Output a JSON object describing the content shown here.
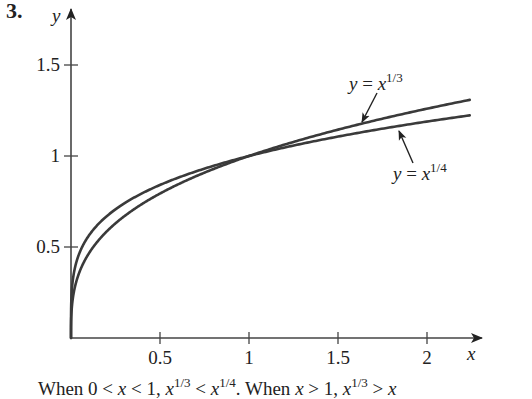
{
  "problem_number": "3.",
  "caption": {
    "prefix": "When 0 < ",
    "var1": "x",
    "mid1": " < 1, ",
    "base1": "x",
    "exp1": "1/3",
    "mid2": " < ",
    "base2": "x",
    "exp2": "1/4",
    "mid3": ". When ",
    "var2": "x",
    "mid4": " > 1, ",
    "base3": "x",
    "exp3": "1/3",
    "mid5": " > ",
    "base4": "x"
  },
  "colors": {
    "curve": "#3a3a3a",
    "axis": "#444444",
    "text": "#222222"
  },
  "chart_data": {
    "type": "line",
    "title": "",
    "xlabel": "x",
    "ylabel": "y",
    "xlim": [
      0,
      2.3
    ],
    "ylim": [
      0,
      1.6
    ],
    "grid": false,
    "legend_position": "annotations",
    "x_ticks": [
      {
        "value": 0.5,
        "label": "0.5"
      },
      {
        "value": 1,
        "label": "1"
      },
      {
        "value": 1.5,
        "label": "1.5"
      },
      {
        "value": 2,
        "label": "2"
      }
    ],
    "y_ticks": [
      {
        "value": 0.5,
        "label": "0.5"
      },
      {
        "value": 1,
        "label": "1"
      },
      {
        "value": 1.5,
        "label": "1.5"
      }
    ],
    "series": [
      {
        "name": "y = x^(1/3)",
        "label_base": "y = x",
        "label_exp": "1/3",
        "exponent": 0.3333333,
        "x": [
          0,
          0.01,
          0.05,
          0.1,
          0.25,
          0.5,
          0.75,
          1,
          1.25,
          1.5,
          1.75,
          2,
          2.24
        ],
        "values": [
          0,
          0.215,
          0.368,
          0.464,
          0.63,
          0.794,
          0.909,
          1,
          1.077,
          1.145,
          1.205,
          1.26,
          1.309
        ]
      },
      {
        "name": "y = x^(1/4)",
        "label_base": "y = x",
        "label_exp": "1/4",
        "exponent": 0.25,
        "x": [
          0,
          0.01,
          0.05,
          0.1,
          0.25,
          0.5,
          0.75,
          1,
          1.25,
          1.5,
          1.75,
          2,
          2.24
        ],
        "values": [
          0,
          0.316,
          0.473,
          0.562,
          0.707,
          0.841,
          0.931,
          1,
          1.057,
          1.107,
          1.15,
          1.189,
          1.223
        ]
      }
    ],
    "annotations": [
      {
        "text": "y = x^(1/3)",
        "points_to_series": 0
      },
      {
        "text": "y = x^(1/4)",
        "points_to_series": 1
      }
    ]
  }
}
